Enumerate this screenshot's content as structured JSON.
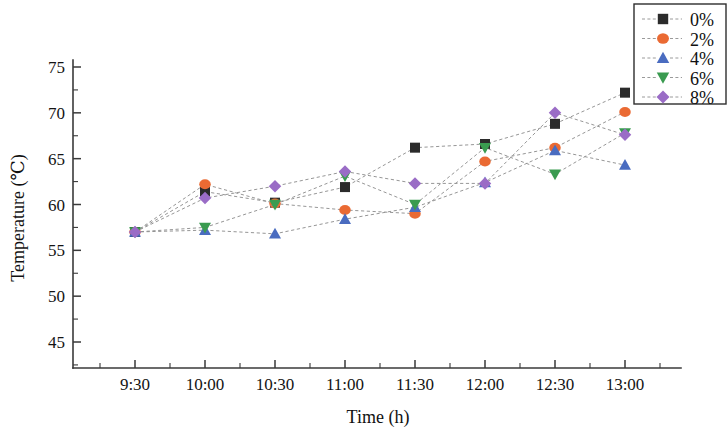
{
  "chart_data": {
    "type": "line",
    "title": "",
    "xlabel": "Time (h)",
    "ylabel": "Temperature (℃)",
    "categories": [
      "9:30",
      "10:00",
      "10:30",
      "11:00",
      "11:30",
      "12:00",
      "12:30",
      "13:00"
    ],
    "x_tick_labels": [
      "9:30",
      "10:00",
      "10:30",
      "11:00",
      "11:30",
      "12:00",
      "12:30",
      "13:00"
    ],
    "y_tick_labels": [
      "45",
      "50",
      "55",
      "60",
      "65",
      "70",
      "75"
    ],
    "y_ticks": [
      45,
      50,
      55,
      60,
      65,
      70,
      75
    ],
    "ylim": [
      43.0,
      76.5
    ],
    "y_minor_interval": 2.5,
    "grid": false,
    "legend_position": "top-right",
    "series": [
      {
        "name": "0%",
        "color": "#2b2b2b",
        "marker": "square",
        "values": [
          57.0,
          61.4,
          60.2,
          61.9,
          66.2,
          66.6,
          68.8,
          72.2
        ]
      },
      {
        "name": "2%",
        "color": "#ea6a33",
        "marker": "circle",
        "values": [
          57.0,
          62.2,
          60.1,
          59.4,
          59.0,
          64.7,
          66.2,
          70.1
        ]
      },
      {
        "name": "4%",
        "color": "#4a6cc0",
        "marker": "triangle-up",
        "values": [
          57.0,
          57.2,
          56.8,
          58.4,
          59.7,
          62.4,
          65.9,
          64.3
        ]
      },
      {
        "name": "6%",
        "color": "#3a9b50",
        "marker": "triangle-down",
        "values": [
          57.0,
          57.5,
          60.0,
          63.1,
          60.0,
          66.2,
          63.3,
          67.8
        ]
      },
      {
        "name": "8%",
        "color": "#9a6cc6",
        "marker": "diamond",
        "values": [
          57.0,
          60.7,
          62.0,
          63.6,
          62.3,
          62.3,
          70.0,
          67.6
        ]
      }
    ]
  },
  "legend": {
    "items": [
      {
        "label": "0%"
      },
      {
        "label": "2%"
      },
      {
        "label": "4%"
      },
      {
        "label": "6%"
      },
      {
        "label": "8%"
      }
    ]
  },
  "axes": {
    "y_title": "Temperature (℃)",
    "x_title": "Time (h)"
  }
}
